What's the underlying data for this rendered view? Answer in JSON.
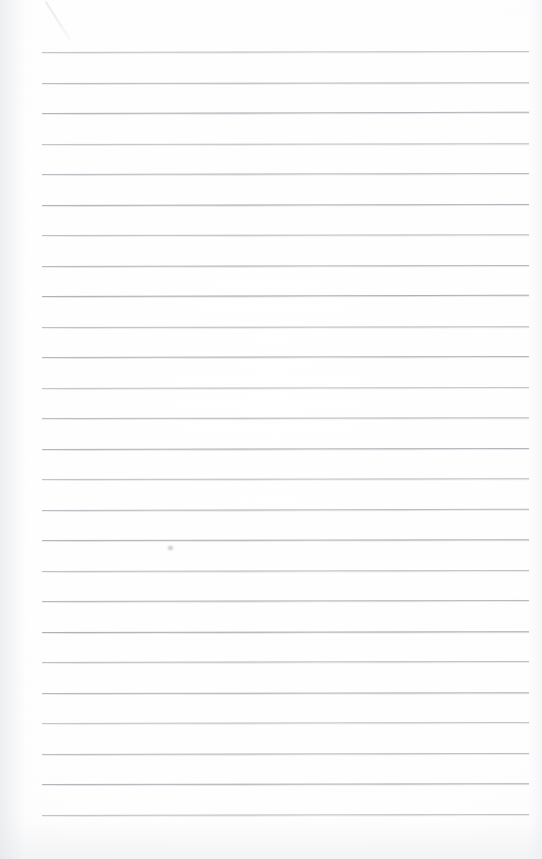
{
  "document": {
    "kind": "scanned-lined-paper",
    "title": "Blank ruled notebook page",
    "page_width": 542,
    "page_height": 859,
    "background_color": "#fefefe",
    "text_content": "",
    "written_text_present": "no"
  },
  "ruling": {
    "line_color": "#a9abb1",
    "line_count": 26,
    "line_thickness_px": 1,
    "line_spacing_px": 30.5,
    "first_line_y": 52,
    "left_margin_x": 42,
    "right_margin_x": 529,
    "line_length_px": 487,
    "margin_rule_present": "no",
    "line_y_positions": [
      52,
      82.5,
      113,
      143.5,
      174,
      204.5,
      235,
      265.5,
      296,
      326.5,
      357,
      387.5,
      418,
      448.5,
      479,
      509.5,
      540,
      570.5,
      601,
      631.5,
      662,
      692.5,
      723,
      753.5,
      784,
      814.5
    ],
    "line_tilts_deg": [
      -0.12,
      -0.1,
      -0.14,
      -0.08,
      -0.11,
      -0.13,
      -0.09,
      -0.12,
      -0.15,
      -0.1,
      -0.11,
      -0.13,
      -0.08,
      -0.12,
      -0.1,
      -0.14,
      -0.09,
      -0.11,
      -0.13,
      -0.1,
      -0.12,
      -0.08,
      -0.11,
      -0.13,
      -0.1,
      -0.12
    ]
  },
  "artifacts": {
    "diagonal_mark": {
      "name": "faint-diagonal-pencil-stroke",
      "x1": 46,
      "y1": 2,
      "x2": 70,
      "y2": 40,
      "color": "#cfd1d6"
    },
    "smudge_speck": {
      "name": "faint-smudge-speck",
      "x": 168,
      "y": 546,
      "color": "#bec0c6"
    },
    "edge_shading": {
      "left": "true",
      "right": "true",
      "bottom": "true"
    }
  }
}
